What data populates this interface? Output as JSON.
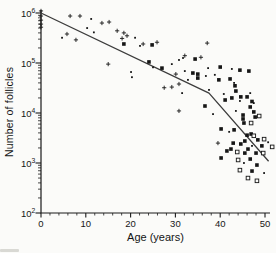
{
  "figure": {
    "background": "#fbfbf9"
  },
  "colors": {
    "ink": "#161616",
    "axis": "#1a1a1a",
    "trend": "#3c3c3c",
    "open_marker_fill": "#fbfbf9"
  },
  "chart_data": {
    "type": "scatter",
    "title": "",
    "xlabel": "Age (years)",
    "ylabel": "Number of follicles",
    "x_ticks": [
      0,
      10,
      20,
      30,
      40,
      50
    ],
    "x_tick_labels": [
      "0",
      "10",
      "20",
      "30",
      "40",
      "50"
    ],
    "x_minor_step": 2,
    "xlim": [
      0,
      51.5
    ],
    "y_scale": "log",
    "y_tick_exponents": [
      2,
      3,
      4,
      5,
      6
    ],
    "y_tick_base": "10",
    "ylim": [
      100,
      1150000
    ],
    "grid": "off",
    "legend": "none",
    "series": [
      {
        "name": "cross-markers",
        "marker": "plus",
        "points": [
          [
            0,
            1100000
          ],
          [
            0,
            870000
          ],
          [
            0,
            720000
          ],
          [
            0,
            600000
          ],
          [
            0,
            520000
          ],
          [
            5.8,
            380000
          ],
          [
            6.5,
            870000
          ],
          [
            7.8,
            290000
          ],
          [
            8.7,
            870000
          ],
          [
            13.6,
            630000
          ],
          [
            15.2,
            660000
          ],
          [
            17,
            440000
          ],
          [
            18.1,
            310000
          ],
          [
            18.5,
            400000
          ],
          [
            19.2,
            350000
          ],
          [
            22.8,
            240000
          ],
          [
            25.9,
            260000
          ],
          [
            15,
            95000
          ],
          [
            27.5,
            32000
          ],
          [
            29.2,
            33000
          ],
          [
            30.1,
            60000
          ],
          [
            30.8,
            38000
          ],
          [
            30.8,
            11000
          ],
          [
            32.1,
            140000
          ],
          [
            35.7,
            130000
          ],
          [
            37.1,
            250000
          ],
          [
            39.5,
            2500
          ]
        ]
      },
      {
        "name": "small-dot-markers",
        "marker": "dot",
        "points": [
          [
            4.7,
            320000
          ],
          [
            10.3,
            500000
          ],
          [
            11.2,
            760000
          ],
          [
            11.8,
            410000
          ],
          [
            21,
            320000
          ],
          [
            22.1,
            220000
          ],
          [
            20.1,
            66000
          ],
          [
            20.3,
            52000
          ],
          [
            25,
            82000
          ],
          [
            29.2,
            95000
          ],
          [
            30.8,
            115000
          ],
          [
            31.7,
            126000
          ],
          [
            32.1,
            69000
          ],
          [
            32.8,
            46000
          ],
          [
            31.5,
            25000
          ],
          [
            36.8,
            55000
          ],
          [
            37.3,
            79000
          ],
          [
            37.5,
            29000
          ],
          [
            38.8,
            58000
          ],
          [
            40.8,
            24000
          ],
          [
            42.6,
            76000
          ],
          [
            43.1,
            40000
          ],
          [
            43.5,
            11000
          ],
          [
            38.4,
            9500
          ],
          [
            44.4,
            17400
          ],
          [
            46.7,
            25000
          ],
          [
            47.5,
            15800
          ],
          [
            42,
            4200
          ],
          [
            47.1,
            2200
          ],
          [
            45.3,
            1000
          ],
          [
            49.8,
            630
          ],
          [
            50.7,
            2600
          ]
        ]
      },
      {
        "name": "filled-square-markers",
        "marker": "square-filled",
        "points": [
          [
            18.5,
            240000
          ],
          [
            24.8,
            230000
          ],
          [
            24.1,
            105000
          ],
          [
            27,
            79000
          ],
          [
            34.4,
            120000
          ],
          [
            33.9,
            63000
          ],
          [
            35,
            60000
          ],
          [
            35,
            50000
          ],
          [
            36.6,
            13800
          ],
          [
            40,
            83000
          ],
          [
            44.4,
            72000
          ],
          [
            46.4,
            69000
          ],
          [
            39.7,
            46000
          ],
          [
            42.2,
            48000
          ],
          [
            43.3,
            35000
          ],
          [
            43.5,
            27500
          ],
          [
            41.1,
            18200
          ],
          [
            42.6,
            20000
          ],
          [
            44.6,
            21000
          ],
          [
            46,
            21000
          ],
          [
            47.1,
            17000
          ],
          [
            45.1,
            9100
          ],
          [
            45.1,
            7600
          ],
          [
            45.3,
            6300
          ],
          [
            46.7,
            13200
          ],
          [
            47.5,
            10500
          ],
          [
            47.8,
            8300
          ],
          [
            40.2,
            4800
          ],
          [
            43.1,
            4600
          ],
          [
            46,
            3600
          ],
          [
            46.9,
            3800
          ],
          [
            48.4,
            2900
          ],
          [
            42.9,
            2500
          ],
          [
            44.6,
            2400
          ],
          [
            45.5,
            2750
          ],
          [
            49.3,
            2200
          ],
          [
            41.5,
            1740
          ],
          [
            42.4,
            1900
          ],
          [
            45.5,
            1580
          ],
          [
            46.2,
            1900
          ],
          [
            48,
            1580
          ],
          [
            40.2,
            1260
          ],
          [
            46.7,
            1200
          ],
          [
            48.2,
            910
          ],
          [
            47.1,
            690
          ]
        ]
      },
      {
        "name": "open-square-markers",
        "marker": "square-open",
        "points": [
          [
            48.7,
            8700
          ],
          [
            46.9,
            6300
          ],
          [
            47.5,
            3500
          ],
          [
            49.8,
            3000
          ],
          [
            51.6,
            2100
          ],
          [
            43.8,
            1660
          ],
          [
            49.6,
            1580
          ],
          [
            44,
            1150
          ],
          [
            44.4,
            720
          ],
          [
            46.2,
            500
          ],
          [
            48.2,
            440
          ]
        ]
      }
    ],
    "trend_line": {
      "name": "biphasic-fit",
      "points": [
        [
          0,
          1000000
        ],
        [
          37.5,
          25000
        ],
        [
          50.8,
          1080
        ]
      ]
    }
  }
}
